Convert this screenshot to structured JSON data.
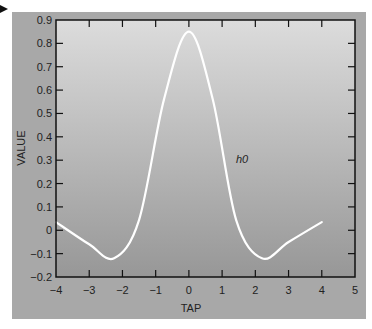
{
  "chart_data": {
    "type": "line",
    "title": "",
    "xlabel": "TAP",
    "ylabel": "VALUE",
    "xlim": [
      -4,
      5
    ],
    "ylim": [
      -0.2,
      0.9
    ],
    "x_ticks": [
      "-4",
      "-3",
      "-2",
      "-1",
      "0",
      "1",
      "2",
      "3",
      "4",
      "5"
    ],
    "y_ticks": [
      "-0.2",
      "-0.1",
      "0",
      "0.1",
      "0.2",
      "0.3",
      "0.4",
      "0.5",
      "0.6",
      "0.7",
      "0.8",
      "0.9"
    ],
    "grid": false,
    "series": [
      {
        "name": "h0",
        "color": "#ffffff",
        "x": [
          -4,
          -3,
          -2.25,
          -1.5,
          -0.75,
          0,
          0.72,
          1.42,
          2.2,
          3,
          4
        ],
        "values": [
          0.035,
          -0.06,
          -0.12,
          0.045,
          0.56,
          0.85,
          0.56,
          0.045,
          -0.12,
          -0.05,
          0.035
        ]
      }
    ],
    "annotations": [
      {
        "text": "h0",
        "x": 1.35,
        "y": 0.3
      }
    ]
  },
  "colors": {
    "panel": "#a8a8a8",
    "plot_top": "#dcdcdc",
    "plot_bottom": "#979797",
    "axis": "#111111",
    "curve": "#ffffff"
  }
}
